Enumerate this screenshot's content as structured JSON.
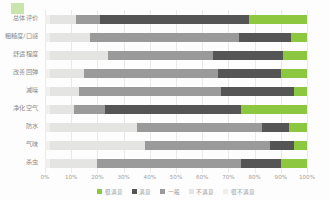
{
  "chart_data": {
    "type": "bar",
    "orientation": "horizontal",
    "stacked": true,
    "normalized": true,
    "title": "",
    "xlabel": "",
    "ylabel": "",
    "xlim": [
      0,
      100
    ],
    "grid": true,
    "legend_position": "bottom",
    "xticks": [
      "0%",
      "10%",
      "20%",
      "30%",
      "40%",
      "50%",
      "60%",
      "70%",
      "80%",
      "90%",
      "100%"
    ],
    "xtick_values": [
      0,
      10,
      20,
      30,
      40,
      50,
      60,
      70,
      80,
      90,
      100
    ],
    "categories": [
      "总体评价",
      "粗糙度/口感",
      "舒适程度",
      "改善回弹",
      "减噪",
      "净化空气",
      "防水",
      "气味",
      "杀虫"
    ],
    "series": [
      {
        "name": "很满意",
        "color": "#8dc63f",
        "values": [
          22,
          6,
          9,
          10,
          5,
          25,
          7,
          5,
          10
        ]
      },
      {
        "name": "满意",
        "color": "#555555",
        "values": [
          57,
          20,
          27,
          24,
          28,
          52,
          10,
          9,
          15
        ]
      },
      {
        "name": "一般",
        "color": "#9a9a9a",
        "values": [
          9,
          57,
          40,
          51,
          54,
          12,
          48,
          48,
          55
        ]
      },
      {
        "name": "不满意",
        "color": "#e4e4e2",
        "values": [
          10,
          15,
          22,
          13,
          11,
          9,
          33,
          36,
          18
        ]
      },
      {
        "name": "很不满意",
        "color": "#f0efed",
        "values": [
          2,
          2,
          2,
          2,
          2,
          2,
          2,
          2,
          2
        ]
      }
    ],
    "stack_render_order": [
      "很不满意",
      "不满意",
      "一般",
      "满意",
      "很满意"
    ]
  },
  "legend": {
    "items": [
      {
        "label": "很满意",
        "color": "#8dc63f"
      },
      {
        "label": "满意",
        "color": "#555555"
      },
      {
        "label": "一般",
        "color": "#9a9a9a"
      },
      {
        "label": "不满意",
        "color": "#e4e4e2"
      },
      {
        "label": "很不满意",
        "color": "#f0efed"
      }
    ]
  },
  "colors": {
    "background": "#fdfdfd",
    "gridline": "#e9e9e9",
    "tick_text": "#a2a2a2",
    "label_text": "#8a8a8a",
    "corner_mark": "#9fd06a"
  }
}
